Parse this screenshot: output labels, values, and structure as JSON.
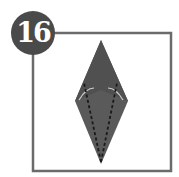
{
  "step": {
    "number": "16"
  },
  "colors": {
    "frame": "#6b6b6b",
    "badge": "#4a4a4a",
    "paper": "#5a5a5a",
    "fold_line": "#1a1a1a",
    "highlight": "#cfcfcf"
  },
  "diagram": {
    "shape": "kite-diamond",
    "fold_lines": "dashed valley folds from bottom tip to upper flaps"
  }
}
